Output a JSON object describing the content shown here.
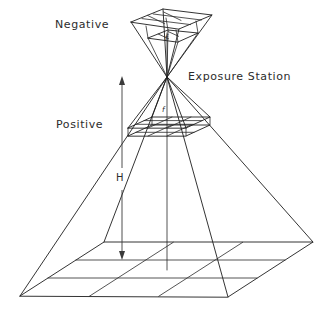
{
  "figure": {
    "background_color": "#ffffff",
    "line_color": "#1d1d1d",
    "text_color": "#2c2c2c",
    "width": 332,
    "height": 317
  },
  "labels": {
    "negative": "Negative",
    "positive": "Positive",
    "exposure_station": "Exposure Station",
    "focal_length_negative": "f",
    "focal_length_positive": "f",
    "flying_height": "H"
  },
  "annotations": {
    "focal_length_symbol": "f",
    "flying_height_symbol": "H",
    "dimension_arrow": "double-headed vertical arrow",
    "dimension_arrow_extent": "from exposure station down to ground plane"
  },
  "geometry": {
    "exposure_station_point": {
      "x": 167,
      "y": 77
    },
    "negative_plane": {
      "role": "negative image plane above the exposure station",
      "corners": [
        {
          "x": 131,
          "y": 22
        },
        {
          "x": 163,
          "y": 9
        },
        {
          "x": 212,
          "y": 15
        },
        {
          "x": 179,
          "y": 29
        }
      ],
      "grid_divisions": 2
    },
    "positive_plane": {
      "role": "positive image plane below the exposure station",
      "corners": [
        {
          "x": 128,
          "y": 134
        },
        {
          "x": 152,
          "y": 123
        },
        {
          "x": 210,
          "y": 123
        },
        {
          "x": 186,
          "y": 134
        }
      ],
      "grid_divisions": 2
    },
    "ground_plane": {
      "role": "ground terrain plane at the base of the projection cone",
      "corners": [
        {
          "x": 20,
          "y": 296
        },
        {
          "x": 104,
          "y": 242
        },
        {
          "x": 313,
          "y": 242
        },
        {
          "x": 228,
          "y": 297
        }
      ],
      "grid_divisions": 2
    },
    "optical_axis": {
      "from": {
        "x": 167,
        "y": 77
      },
      "to": {
        "x": 167,
        "y": 270
      }
    }
  },
  "icons": {
    "arrow_up": "arrow-up-icon",
    "arrow_down": "arrow-down-icon"
  }
}
